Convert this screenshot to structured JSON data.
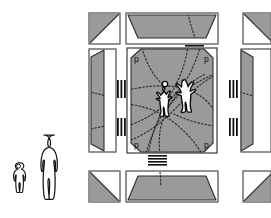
{
  "figure": {
    "background_color": "#ffffff",
    "fill_gray": "#9a9a9a",
    "outline_color": "#1a1a1a",
    "dotted_color": "#2b2b2b",
    "figure_fill": "#ffffff"
  },
  "scale_figures": {
    "name": "human-scale-reference",
    "count": 2,
    "items": [
      {
        "label": "child-figure",
        "height_px": 48
      },
      {
        "label": "adult-figure",
        "height_px": 82
      }
    ]
  },
  "plan": {
    "grid_rows": 3,
    "grid_cols": 3,
    "corner_panels": [
      {
        "position": "top-left",
        "shape": "triangle-cut-lower-left"
      },
      {
        "position": "top-right",
        "shape": "triangle-cut-lower-right"
      },
      {
        "position": "bottom-left",
        "shape": "triangle-cut-upper-left"
      },
      {
        "position": "bottom-right",
        "shape": "triangle-cut-upper-right"
      }
    ],
    "edge_panels": [
      {
        "position": "top",
        "shape": "trapezoid"
      },
      {
        "position": "bottom",
        "shape": "trapezoid"
      },
      {
        "position": "left",
        "shape": "trapezoid"
      },
      {
        "position": "right",
        "shape": "trapezoid"
      }
    ],
    "hatch_marks": [
      {
        "position": "top",
        "orientation": "horizontal",
        "bars": 4
      },
      {
        "position": "bottom",
        "orientation": "horizontal",
        "bars": 4
      },
      {
        "position": "left-upper",
        "orientation": "vertical",
        "bars": 3
      },
      {
        "position": "left-lower",
        "orientation": "vertical",
        "bars": 3
      },
      {
        "position": "right-upper",
        "orientation": "vertical",
        "bars": 3
      },
      {
        "position": "right-lower",
        "orientation": "vertical",
        "bars": 3
      }
    ]
  },
  "courtyard": {
    "name": "central-courtyard",
    "corner_labels": [
      {
        "id": "p-top-left",
        "text": "p"
      },
      {
        "id": "p-top-right",
        "text": "p"
      },
      {
        "id": "p-bottom-left",
        "text": "p"
      },
      {
        "id": "p-bottom-right",
        "text": "p"
      }
    ],
    "path_lines": "dotted-curved-desire-paths",
    "occupants": [
      {
        "label": "adult-figure-courtyard"
      },
      {
        "label": "child-figure-courtyard"
      }
    ]
  }
}
